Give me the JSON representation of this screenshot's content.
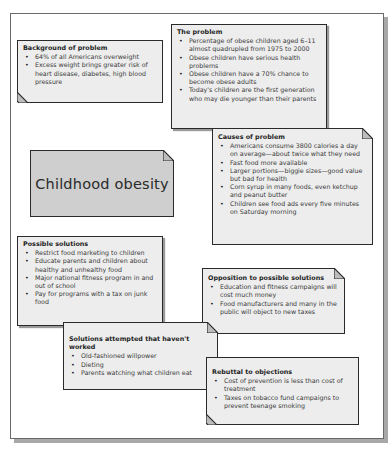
{
  "diagram": {
    "title": "Childhood obesity",
    "colors": {
      "note_fill": "#ededed",
      "center_fill": "#cfcfcf",
      "border": "#2a2a2a",
      "shadow": "#a8a8a8"
    },
    "notes": {
      "background": {
        "heading": "Background of problem",
        "items": [
          "64% of all Americans overweight",
          "Excess weight brings greater risk of heart disease, diabetes, high blood pressure"
        ]
      },
      "problem": {
        "heading": "The problem",
        "items": [
          "Percentage of obese children aged 6–11 almost quadrupled from 1975 to 2000",
          "Obese children have serious health problems",
          "Obese children have a 70% chance to become obese adults",
          "Today's children are the first generation who may die younger than their parents"
        ]
      },
      "causes": {
        "heading": "Causes of problem",
        "items": [
          "Americans consume 3800 calories a day on average—about twice what they need",
          "Fast food more available",
          "Larger portions—biggie sizes—good value but bad for health",
          "Corn syrup in many foods, even ketchup and peanut butter",
          "Children see food ads every five minutes on Saturday morning"
        ]
      },
      "possible_solutions": {
        "heading": "Possible solutions",
        "items": [
          "Restrict food marketing to children",
          "Educate parents and children about healthy and unhealthy food",
          "Major national fitness program in and out of school",
          "Pay for programs with a tax on junk food"
        ]
      },
      "opposition": {
        "heading": "Opposition to possible solutions",
        "items": [
          "Education and fitness campaigns will cost much money",
          "Food manufacturers and many in the public will object to new taxes"
        ]
      },
      "attempted": {
        "heading": "Solutions attempted that haven't worked",
        "items": [
          "Old-fashioned willpower",
          "Dieting",
          "Parents watching what children eat"
        ]
      },
      "rebuttal": {
        "heading": "Rebuttal to objections",
        "items": [
          "Cost of prevention is less than cost of treatment",
          "Taxes on tobacco fund campaigns to prevent teenage smoking"
        ]
      }
    }
  }
}
